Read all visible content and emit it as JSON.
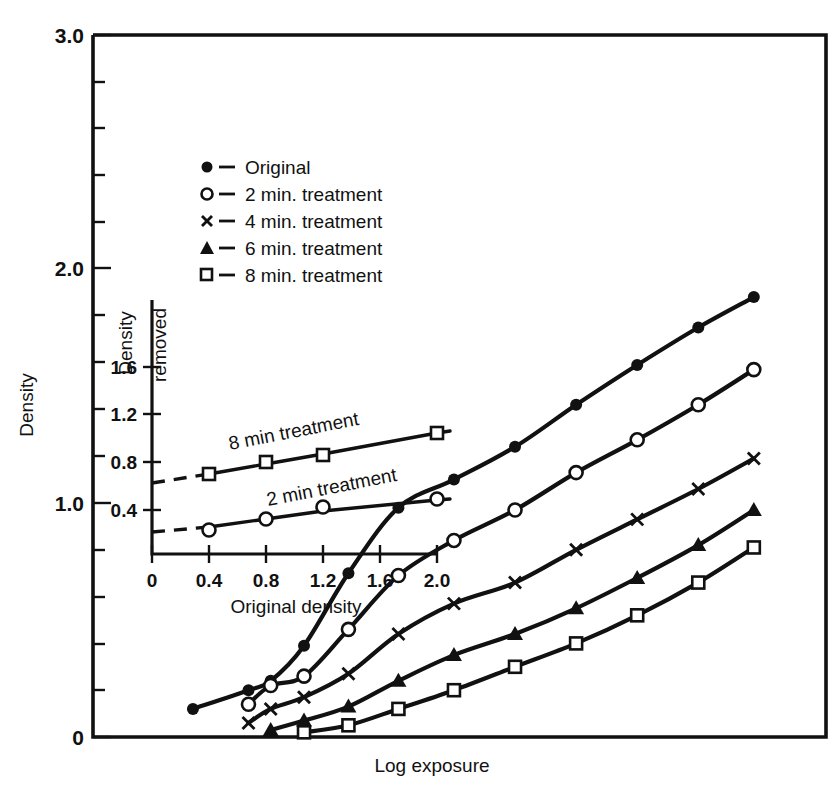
{
  "chart_data": {
    "type": "line",
    "title": "",
    "xlabel": "Log exposure",
    "ylabel": "Density",
    "ylim": [
      0,
      3.0
    ],
    "y_ticks": [
      "0",
      "1.0",
      "2.0",
      "3.0"
    ],
    "y_tick_values": [
      0,
      1.0,
      2.0,
      3.0
    ],
    "y_minor_step": 0.2,
    "x_ticks": [],
    "grid": false,
    "legend_position": "upper-left-inside",
    "frame": "box",
    "series": [
      {
        "name": "Original",
        "marker": "filled-circle",
        "x": [
          0.9,
          1.4,
          1.6,
          1.9,
          2.3,
          2.75,
          3.25,
          3.8,
          4.35,
          4.9,
          5.45,
          5.95
        ],
        "values": [
          0.12,
          0.2,
          0.24,
          0.39,
          0.7,
          0.98,
          1.1,
          1.24,
          1.42,
          1.59,
          1.75,
          1.88
        ]
      },
      {
        "name": "2 min. treatment",
        "marker": "open-circle",
        "x": [
          1.4,
          1.6,
          1.9,
          2.3,
          2.75,
          3.25,
          3.8,
          4.35,
          4.9,
          5.45,
          5.95
        ],
        "values": [
          0.14,
          0.22,
          0.26,
          0.46,
          0.69,
          0.84,
          0.97,
          1.13,
          1.27,
          1.42,
          1.57
        ]
      },
      {
        "name": "4 min.    treatment",
        "marker": "cross",
        "x": [
          1.4,
          1.6,
          1.9,
          2.3,
          2.75,
          3.25,
          3.8,
          4.35,
          4.9,
          5.45,
          5.95
        ],
        "values": [
          0.06,
          0.12,
          0.17,
          0.27,
          0.44,
          0.57,
          0.66,
          0.8,
          0.93,
          1.06,
          1.19
        ]
      },
      {
        "name": "6 min. treatment",
        "marker": "filled-triangle",
        "x": [
          1.6,
          1.9,
          2.3,
          2.75,
          3.25,
          3.8,
          4.35,
          4.9,
          5.45,
          5.95
        ],
        "values": [
          0.03,
          0.07,
          0.13,
          0.24,
          0.35,
          0.44,
          0.55,
          0.68,
          0.82,
          0.97
        ]
      },
      {
        "name": "8 min. treatment",
        "marker": "open-square",
        "x": [
          1.9,
          2.3,
          2.75,
          3.25,
          3.8,
          4.35,
          4.9,
          5.45,
          5.95
        ],
        "values": [
          0.02,
          0.05,
          0.12,
          0.2,
          0.3,
          0.4,
          0.52,
          0.66,
          0.81
        ]
      }
    ]
  },
  "inset_chart_data": {
    "type": "line",
    "title": "",
    "xlabel": "Original density",
    "ylabel_line1": "Density",
    "ylabel_line2": "removed",
    "xlim": [
      0,
      2.3
    ],
    "ylim": [
      0,
      1.85
    ],
    "x_ticks": [
      "0",
      "0.4",
      "0.8",
      "1.2",
      "1.6",
      "2.0"
    ],
    "x_tick_values": [
      0,
      0.4,
      0.8,
      1.2,
      1.6,
      2.0
    ],
    "y_ticks": [
      "0.4",
      "0.8",
      "1.2",
      "1.6"
    ],
    "y_tick_values": [
      0.4,
      0.8,
      1.2,
      1.6
    ],
    "grid": false,
    "series": [
      {
        "name": "8 min treatment",
        "marker": "open-square",
        "x": [
          0.4,
          0.8,
          1.2,
          2.0
        ],
        "values": [
          0.62,
          0.76,
          0.87,
          1.05
        ],
        "label": "8 min treatment",
        "dashed_extrapolation": true
      },
      {
        "name": "2 min treatment",
        "marker": "open-circle",
        "x": [
          0.4,
          0.8,
          1.2,
          2.0
        ],
        "values": [
          0.2,
          0.28,
          0.36,
          0.42
        ],
        "label": "2 min treatment",
        "dashed_extrapolation": true
      }
    ]
  },
  "legend": {
    "items": [
      {
        "marker": "filled-circle",
        "dash": "—",
        "label": "Original"
      },
      {
        "marker": "open-circle",
        "dash": "—",
        "label": "2 min. treatment"
      },
      {
        "marker": "cross",
        "dash": "—",
        "label": "4 min.    treatment"
      },
      {
        "marker": "filled-triangle",
        "dash": "—",
        "label": "6 min. treatment"
      },
      {
        "marker": "open-square",
        "dash": "—",
        "label": "8 min. treatment"
      }
    ]
  },
  "axes": {
    "main_y_label": "Density",
    "main_x_label": "Log exposure",
    "main_y_tick_0": "0",
    "main_y_tick_1": "1.0",
    "main_y_tick_2": "2.0",
    "main_y_tick_3": "3.0"
  },
  "inset_axes": {
    "y_label_top": "Density",
    "y_label_bottom": "removed",
    "x_label": "Original density",
    "y_tick_04": "0.4",
    "y_tick_08": "0.8",
    "y_tick_12": "1.2",
    "y_tick_16": "1.6",
    "x_tick_0": "0",
    "x_tick_04": "0.4",
    "x_tick_08": "0.8",
    "x_tick_12": "1.2",
    "x_tick_16": "1.6",
    "x_tick_20": "2.0"
  },
  "inset_labels": {
    "series_8min": "8 min treatment",
    "series_2min": "2 min treatment"
  },
  "colors": {
    "ink": "#111111",
    "background": "#ffffff"
  }
}
